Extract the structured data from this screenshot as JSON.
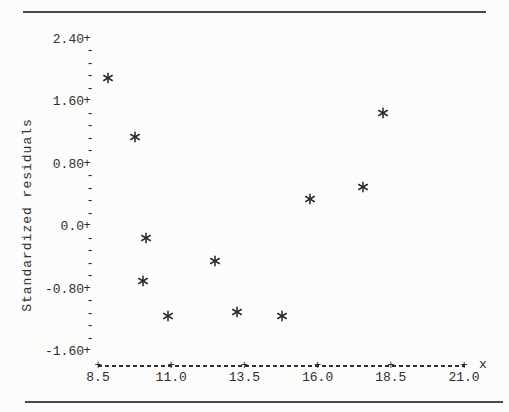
{
  "colors": {
    "ink": "#2e2e2e",
    "rule": "#4a4a4a",
    "background": "#fcfcfa"
  },
  "chart_data": {
    "type": "scatter",
    "title": "",
    "xlabel": "x",
    "ylabel": "Standardized residuals",
    "marker": "asterisk",
    "grid": false,
    "xlim": [
      8.5,
      21.0
    ],
    "ylim": [
      -1.79,
      2.56
    ],
    "x_ticks": {
      "values": [
        8.5,
        11.0,
        13.5,
        16.0,
        18.5,
        21.0
      ],
      "labels": [
        "8.5",
        "11.0",
        "13.5",
        "16.0",
        "18.5",
        "21.0"
      ]
    },
    "y_ticks": {
      "values": [
        2.4,
        1.6,
        0.8,
        0.0,
        -0.8,
        -1.6
      ],
      "labels": [
        "2.40",
        "1.60",
        "0.80",
        "0.0",
        "-0.80",
        "-1.60"
      ],
      "minor_per_interval": 4
    },
    "points": [
      {
        "x": 8.85,
        "residual": 1.9
      },
      {
        "x": 9.75,
        "residual": 1.15
      },
      {
        "x": 10.15,
        "residual": -0.15
      },
      {
        "x": 10.05,
        "residual": -0.7
      },
      {
        "x": 10.9,
        "residual": -1.15
      },
      {
        "x": 12.5,
        "residual": -0.45
      },
      {
        "x": 13.25,
        "residual": -1.1
      },
      {
        "x": 14.8,
        "residual": -1.15
      },
      {
        "x": 15.75,
        "residual": 0.35
      },
      {
        "x": 17.55,
        "residual": 0.5
      },
      {
        "x": 18.25,
        "residual": 1.45
      }
    ]
  }
}
